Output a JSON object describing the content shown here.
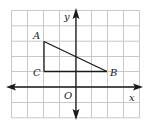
{
  "figure": {
    "type": "coordinate-grid",
    "grid": {
      "columns": 8,
      "rows": 7,
      "color": "#c8c8c8"
    },
    "axes": {
      "x_label": "x",
      "y_label": "y",
      "origin_label": "O",
      "color": "#1a1a1a"
    },
    "triangle": {
      "vertices": [
        {
          "label": "A",
          "grid_x": -2,
          "grid_y": 3
        },
        {
          "label": "B",
          "grid_x": 2,
          "grid_y": 1
        },
        {
          "label": "C",
          "grid_x": -2,
          "grid_y": 1
        }
      ],
      "color": "#1a1a1a"
    }
  }
}
